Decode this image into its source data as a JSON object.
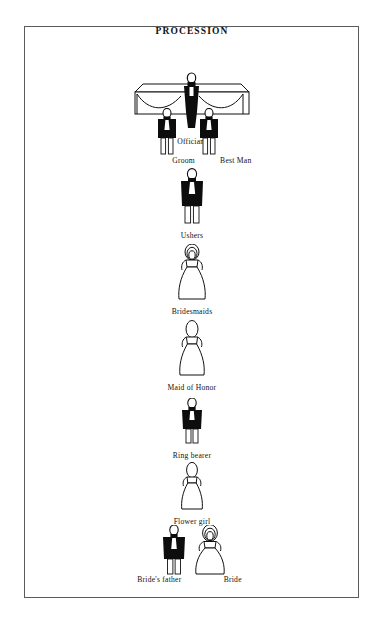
{
  "page": {
    "title": "PROCESSION",
    "background_color": "#ffffff",
    "border_color": "#5b5b5b",
    "ink_color": "#111111"
  },
  "figures": {
    "dark_fill": "#0d0d0d",
    "light_fill": "#ffffff",
    "outline": "#111111"
  },
  "rows": [
    {
      "id": "officiant",
      "labels": [
        {
          "text": "Officiant",
          "x_pct": 50
        }
      ],
      "roles": [
        "Officiant"
      ]
    },
    {
      "id": "groom-bestman",
      "labels": [
        {
          "text": "Groom",
          "x_pct": 36
        },
        {
          "text": "Best Man",
          "x_pct": 68
        }
      ],
      "roles": [
        "Groom",
        "Best Man"
      ]
    },
    {
      "id": "ushers",
      "labels": [
        {
          "text": "Ushers",
          "x_pct": 50
        }
      ],
      "roles": [
        "Ushers"
      ]
    },
    {
      "id": "bridesmaids",
      "labels": [
        {
          "text": "Bridesmaids",
          "x_pct": 50
        }
      ],
      "roles": [
        "Bridesmaids"
      ]
    },
    {
      "id": "maid-of-honor",
      "labels": [
        {
          "text": "Maid of Honor",
          "x_pct": 50
        }
      ],
      "roles": [
        "Maid of Honor"
      ]
    },
    {
      "id": "ring-bearer",
      "labels": [
        {
          "text": "Ring bearer",
          "x_pct": 50
        }
      ],
      "roles": [
        "Ring bearer"
      ]
    },
    {
      "id": "flower-girl",
      "labels": [
        {
          "text": "Flower girl",
          "x_pct": 50
        }
      ],
      "roles": [
        "Flower girl"
      ]
    },
    {
      "id": "father-bride",
      "labels": [
        {
          "text": "Bride's father",
          "x_pct": 34
        },
        {
          "text": "Bride",
          "x_pct": 68
        }
      ],
      "roles": [
        "Bride's father",
        "Bride"
      ]
    }
  ]
}
